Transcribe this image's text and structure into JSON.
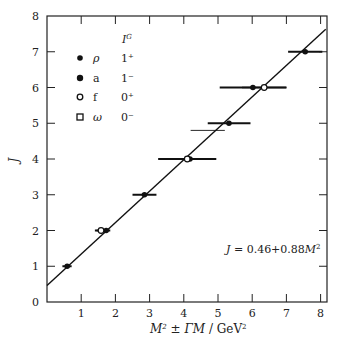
{
  "chart_data": {
    "type": "scatter",
    "title": "",
    "xlabel": "M² ± ΓM / GeV²",
    "ylabel": "J",
    "xlim": [
      0,
      8.2
    ],
    "ylim": [
      0,
      8
    ],
    "x_ticks": [
      1,
      2,
      3,
      4,
      5,
      6,
      7,
      8
    ],
    "y_ticks": [
      0,
      1,
      2,
      3,
      4,
      5,
      6,
      7,
      8
    ],
    "grid": false,
    "legend_position": "upper-left",
    "legend": {
      "header": "I^G",
      "entries": [
        {
          "marker": "filled-circle",
          "particle": "ρ",
          "ig": "1⁺"
        },
        {
          "marker": "filled-circle-large",
          "particle": "a",
          "ig": "1⁻"
        },
        {
          "marker": "open-circle",
          "particle": "f",
          "ig": "0⁺"
        },
        {
          "marker": "open-square",
          "particle": "ω",
          "ig": "0⁻"
        }
      ]
    },
    "fit_line": {
      "intercept": 0.46,
      "slope": 0.88,
      "label": "J = 0.46 + 0.88M²"
    },
    "series": [
      {
        "name": "ρ / a (filled)",
        "marker": "filled-circle",
        "points": [
          {
            "J": 1,
            "M2": 0.59,
            "err_lo": 0.45,
            "err_hi": 0.72
          },
          {
            "J": 2,
            "M2": 1.73,
            "err_lo": 1.4,
            "err_hi": 1.85
          },
          {
            "J": 3,
            "M2": 2.85,
            "err_lo": 2.5,
            "err_hi": 3.2
          },
          {
            "J": 4,
            "M2": 4.18,
            "err_lo": 3.25,
            "err_hi": 4.95
          },
          {
            "J": 5,
            "M2": 5.32,
            "err_lo": 4.7,
            "err_hi": 5.95
          },
          {
            "J": 6,
            "M2": 6.02,
            "err_lo": 5.05,
            "err_hi": 7.0
          },
          {
            "J": 7,
            "M2": 7.55,
            "err_lo": 7.05,
            "err_hi": 8.05
          }
        ]
      },
      {
        "name": "f (open)",
        "marker": "open-circle",
        "points": [
          {
            "J": 2,
            "M2": 1.58,
            "err_lo": 1.45,
            "err_hi": 1.75
          },
          {
            "J": 4,
            "M2": 4.1,
            "err_lo": 3.4,
            "err_hi": 4.8
          },
          {
            "J": 6,
            "M2": 6.35,
            "err_lo": 5.7,
            "err_hi": 7.0
          }
        ]
      },
      {
        "name": "bare error bar",
        "marker": "none",
        "points": [
          {
            "J": 4.8,
            "M2": 4.95,
            "err_lo": 4.2,
            "err_hi": 5.2
          }
        ]
      }
    ],
    "annotation": "J = 0.46 + 0.88M²"
  },
  "labels": {
    "y_axis": "J",
    "x_axis_M": "M",
    "x_axis_sup": "2",
    "x_axis_pm": " ± ",
    "x_axis_GM": "ΓM",
    "x_axis_unit": " / GeV",
    "x_axis_unit_sup": "2",
    "legend_header": "I",
    "legend_header_sup": "G",
    "fit_prefix": "J",
    "fit_mid": " = 0.46+0.88",
    "fit_M": "M",
    "fit_sup": "2"
  }
}
